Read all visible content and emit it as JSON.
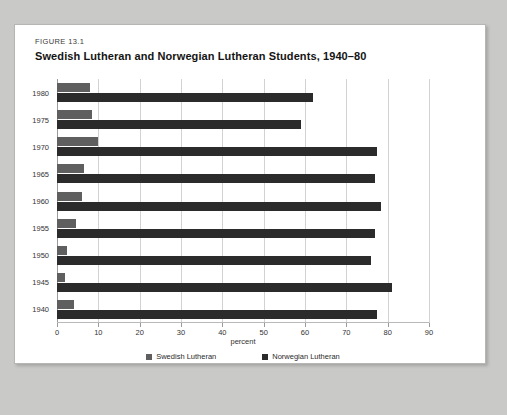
{
  "figure": {
    "label": "FIGURE 13.1",
    "title": "Swedish Lutheran and Norwegian Lutheran Students, 1940–80"
  },
  "chart_data": {
    "type": "bar",
    "orientation": "horizontal",
    "title": "Swedish Lutheran and Norwegian Lutheran Students, 1940–80",
    "xlabel": "percent",
    "ylabel": "",
    "xlim": [
      0,
      90
    ],
    "xticks": [
      0,
      10,
      20,
      30,
      40,
      50,
      60,
      70,
      80,
      90
    ],
    "grid": true,
    "legend_position": "bottom",
    "categories": [
      "1940",
      "1945",
      "1950",
      "1955",
      "1960",
      "1965",
      "1970",
      "1975",
      "1980"
    ],
    "series": [
      {
        "name": "Swedish Lutheran",
        "color": "#5f5f5f",
        "values": [
          4,
          2,
          2.5,
          4.5,
          6,
          6.5,
          10,
          8.5,
          8
        ]
      },
      {
        "name": "Norwegian Lutheran",
        "color": "#2b2b2b",
        "values": [
          77.5,
          81,
          76,
          77,
          78.5,
          77,
          77.5,
          59,
          62
        ]
      }
    ]
  },
  "colors": {
    "page_background": "#c9c9c7",
    "figure_background": "#ffffff",
    "gridline": "#d2d2d2",
    "axis": "#9a9a9a"
  }
}
